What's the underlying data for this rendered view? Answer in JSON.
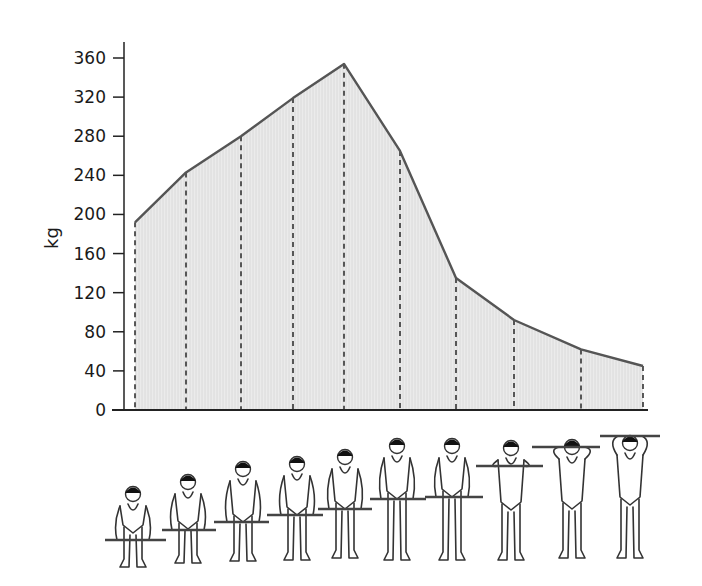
{
  "chart_data": {
    "type": "area",
    "title": "",
    "xlabel": "",
    "ylabel": "kg",
    "ylim": [
      0,
      360
    ],
    "yticks": [
      0,
      40,
      80,
      120,
      160,
      200,
      240,
      280,
      320,
      360
    ],
    "grid": false,
    "legend": null,
    "categories": [
      "Phase 1",
      "Phase 2",
      "Phase 3",
      "Phase 4",
      "Phase 5",
      "Phase 6",
      "Phase 7",
      "Phase 8",
      "Phase 9",
      "Phase 10"
    ],
    "series": [
      {
        "name": "Force (kg)",
        "values": [
          192,
          243,
          280,
          319,
          354,
          265,
          135,
          92,
          62,
          45
        ]
      }
    ],
    "annotations": "Each data point is marked with a dashed vertical line down to the x-axis; below each point is a line drawing of a weightlifter at a successive stage of the lift, raising a barbell from the floor to overhead.",
    "fill_color": "#e6e6e6",
    "line_color": "#555555"
  },
  "figures": {
    "count": 10,
    "description": "weightlifter-stage-figures"
  }
}
